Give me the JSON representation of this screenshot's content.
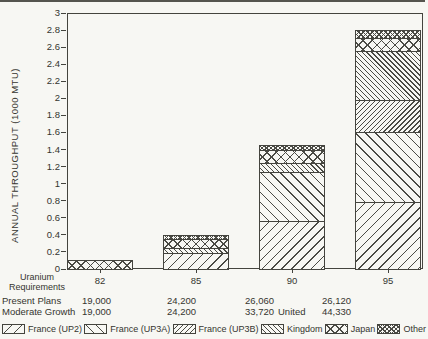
{
  "chart_data": {
    "type": "bar",
    "stacked": true,
    "title": "",
    "xlabel": "",
    "ylabel": "ANNUAL THROUGHPUT (1000 MTU)",
    "ylim": [
      0,
      3
    ],
    "ytick_step": 0.2,
    "grid": false,
    "legend_position": "bottom",
    "categories": [
      "82",
      "85",
      "90",
      "95"
    ],
    "series": [
      {
        "name": "France (UP2)",
        "pattern": "diag-forward-sparse",
        "values": [
          0,
          0.2,
          0.58,
          0.8
        ]
      },
      {
        "name": "France (UP3A)",
        "pattern": "diag-back-sparse",
        "values": [
          0,
          0,
          0.57,
          0.82
        ]
      },
      {
        "name": "France (UP3B)",
        "pattern": "diag-forward-dense",
        "values": [
          0,
          0,
          0,
          0.38
        ]
      },
      {
        "name": "United Kingdom",
        "pattern": "diag-back-dense",
        "values": [
          0,
          0.06,
          0.1,
          0.57
        ]
      },
      {
        "name": "Japan",
        "pattern": "crosshatch-sparse",
        "values": [
          0.1,
          0.1,
          0.15,
          0.15
        ]
      },
      {
        "name": "Other",
        "pattern": "crosshatch-dense",
        "values": [
          0,
          0.04,
          0.05,
          0.08
        ]
      }
    ],
    "stack_totals": [
      0.1,
      0.4,
      1.45,
      2.8
    ]
  },
  "table": {
    "header": {
      "line1": "Uranium",
      "line2": "Requirements"
    },
    "rows": [
      {
        "label": "Present Plans",
        "values": [
          "19,000",
          "24,200",
          "26,060",
          "26,120"
        ]
      },
      {
        "label": "Moderate Growth",
        "values": [
          "19,000",
          "24,200",
          "33,720",
          "44,330"
        ]
      }
    ]
  },
  "legend": {
    "united_overflow": "United",
    "items": [
      {
        "label": "France (UP2)",
        "pattern": "diag-forward-sparse"
      },
      {
        "label": "France (UP3A)",
        "pattern": "diag-back-sparse"
      },
      {
        "label": "France (UP3B)",
        "pattern": "diag-forward-dense"
      },
      {
        "label": "Kingdom",
        "pattern": "diag-back-dense"
      },
      {
        "label": "Japan",
        "pattern": "crosshatch-sparse"
      },
      {
        "label": "Other",
        "pattern": "crosshatch-dense"
      }
    ]
  },
  "colors": {
    "ink": "#44443e",
    "background": "#f7f7f3"
  }
}
